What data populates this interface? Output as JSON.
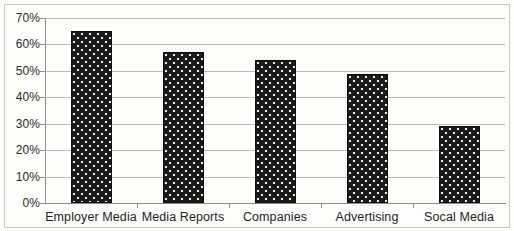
{
  "chart_data": {
    "type": "bar",
    "title": "",
    "subtitle": "",
    "xlabel": "",
    "ylabel": "",
    "categories": [
      "Employer Media",
      "Media Reports",
      "Companies",
      "Advertising",
      "Socal Media"
    ],
    "values": [
      65,
      57,
      54,
      49,
      29
    ],
    "value_labels": [
      "65%",
      "57%",
      "54%",
      "49%",
      "29%"
    ],
    "ylim": [
      0,
      70
    ],
    "y_ticks": [
      0,
      10,
      20,
      30,
      40,
      50,
      60,
      70
    ],
    "y_tick_labels": [
      "0%",
      "10%",
      "20%",
      "30%",
      "40%",
      "50%",
      "60%",
      "70%"
    ],
    "grid": "horizontal",
    "legend": "none",
    "series": [
      {
        "name": "",
        "values": [
          65,
          57,
          54,
          49,
          29
        ]
      }
    ],
    "colors": {
      "bar_fill": "#1b1b1b",
      "bar_pattern_dot": "#ffffff",
      "gridline": "#b9b9b5",
      "axis": "#8d8d89",
      "text": "#1e1e1e",
      "background": "#fdfdfc"
    }
  }
}
